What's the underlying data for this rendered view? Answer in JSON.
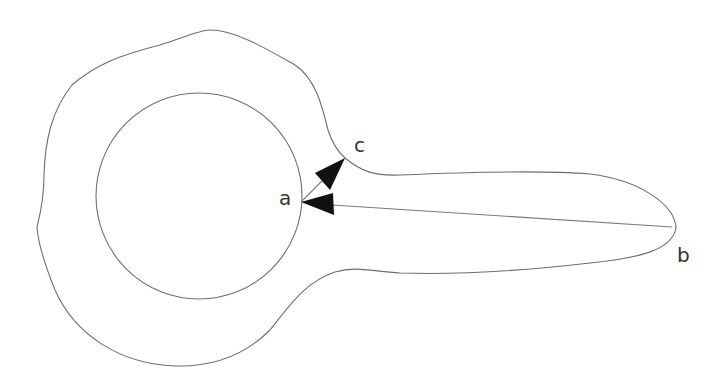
{
  "diagram": {
    "type": "geometric-region-with-vectors",
    "shapes": [
      {
        "name": "outer-region",
        "kind": "closed-curve",
        "description": "blob-shaped region with a long tail extending right"
      },
      {
        "name": "inner-circle",
        "kind": "circle",
        "cx": 200,
        "cy": 196,
        "r": 103
      }
    ],
    "points": [
      {
        "id": "a",
        "label": "a",
        "x": 301,
        "y": 202
      },
      {
        "id": "b",
        "label": "b",
        "x": 672,
        "y": 227
      },
      {
        "id": "c",
        "label": "c",
        "x": 345,
        "y": 158
      }
    ],
    "arrows": [
      {
        "from": "b",
        "to": "a"
      },
      {
        "from": "a",
        "to": "c"
      }
    ],
    "colors": {
      "stroke": "#6e6e6e",
      "arrowhead": "#111111",
      "text": "#333333",
      "background": "#ffffff"
    }
  },
  "labels": {
    "a": "a",
    "b": "b",
    "c": "c"
  }
}
